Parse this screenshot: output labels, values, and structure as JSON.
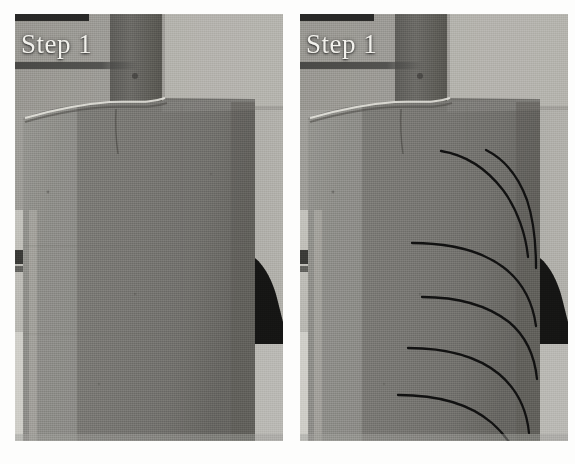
{
  "figure": {
    "kind": "photograph-pair",
    "background_color": "#ffffff",
    "width": 575,
    "height": 464
  },
  "panels": [
    {
      "id": "left",
      "caption": "Step 1",
      "caption_color": "#f2f1ec",
      "has_crack_annotations": false,
      "description_labels": {
        "loading_plate": "loading-plate",
        "specimen": "specimen-block",
        "interface_crack": "interface-crack-highlight",
        "background": "test-rig-background"
      }
    },
    {
      "id": "right",
      "caption": "Step 1",
      "caption_color": "#f2f1ec",
      "has_crack_annotations": true,
      "crack_count": 6,
      "crack_color": "#111111",
      "description_labels": {
        "loading_plate": "loading-plate",
        "specimen": "specimen-block",
        "interface_crack": "interface-crack-highlight",
        "background": "test-rig-background"
      }
    }
  ],
  "tones": {
    "background_wall": "#a9a8a3",
    "background_wall_dark": "#8e8d88",
    "specimen_face": "#7c7b77",
    "specimen_face_light": "#8a8985",
    "specimen_edge_light": "#b4b3ad",
    "loading_plate": "#63625e",
    "shadow_black": "#121212",
    "highlight_white": "#e8e7e0",
    "bench_light": "#cfcec8"
  },
  "crack_paths": [
    {
      "name": "crack-1",
      "d": "M141,137 C166,141 186,154 203,176 C218,196 226,222 228,243"
    },
    {
      "name": "crack-2",
      "d": "M186,136 C206,146 219,164 227,186 C234,207 236,232 236,254"
    },
    {
      "name": "crack-3",
      "d": "M112,229 C150,229 180,236 203,253 C223,268 233,290 236,312"
    },
    {
      "name": "crack-4",
      "d": "M122,283 C158,283 187,291 209,308 C227,323 235,345 237,365"
    },
    {
      "name": "crack-5",
      "d": "M108,334 C146,334 177,342 199,360 C218,376 227,398 229,419"
    },
    {
      "name": "crack-6",
      "d": "M98,381 C138,381 170,390 192,409 C210,425 218,441 220,456"
    }
  ]
}
